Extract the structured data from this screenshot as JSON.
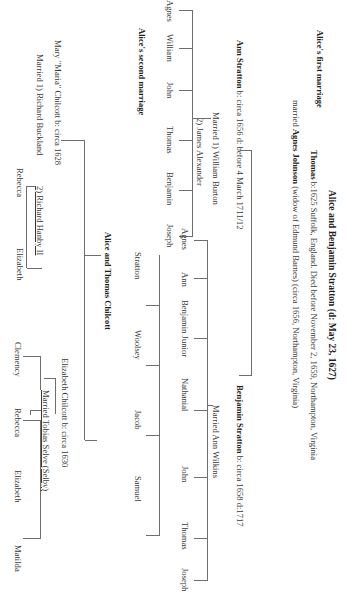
{
  "title": "Alice and Benjamin Stratton (d: May 23, 1627)",
  "first_marriage": {
    "heading": "Alice's first marriage",
    "thomas": {
      "name": "Thomas",
      "details": " b:1625 Suffolk, England. Died before November 2, 1659, Northampton, Virginia"
    },
    "spouse": {
      "prefix": "married ",
      "name": "Agnes Johnson",
      "details": " (widow of Edmund Barnes)  (circa 1656, Northampton, Virginia)"
    },
    "ann": {
      "name": "Ann Stratton",
      "details": " b: circa 1656 d: before 4 March 1711/12",
      "married1": "Married 1) William Burton",
      "married2": "2) James Alexander",
      "children": [
        "Agnes",
        "William",
        "John",
        "Thomas",
        "Benjamin",
        "Joseph"
      ]
    },
    "benjamin": {
      "name": "Benjamin Stratton",
      "details": " b: circa 1658 d:1717",
      "married": "Married Ann Wilkins",
      "children": [
        "Agnes",
        "Ann",
        "Benjamin Junior",
        "Nathanial",
        "John",
        "Thomas",
        "Joseph"
      ]
    }
  },
  "second_marriage": {
    "heading": "Alice's second marriage",
    "couple": "Alice and Thomas Chilcott",
    "chilcott_children_line": [
      "Stratton",
      "Woolsey",
      "Jacob",
      "Samuel"
    ],
    "mary": {
      "name": "Mary \"Maria\" Chilcott  b: circa 1628",
      "married1": "Married 1) Richard Buckland",
      "married2": "2) Richard Hanby II",
      "children": [
        "Rebecca",
        "Elizabeth"
      ]
    },
    "elizabeth": {
      "name": "Elizabeth Chilcott b: circa 1630",
      "married": "Married Tobias Selve (Selby)",
      "children": [
        "Clemency",
        "Rebecca",
        "Elizabeth",
        "Matilda"
      ]
    }
  }
}
